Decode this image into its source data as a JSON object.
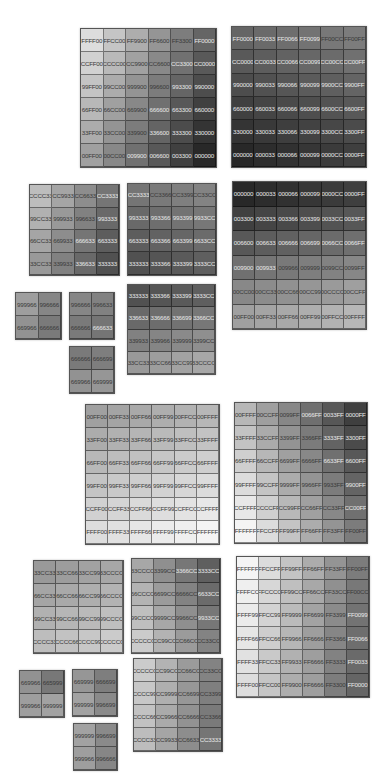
{
  "grids": [
    {
      "id": "g1",
      "x": 80,
      "y": 28,
      "w": 137,
      "h": 140,
      "cols": 6,
      "rows": [
        [
          "FFFF00",
          "FFCC00",
          "FF9900",
          "FF6600",
          "FF3300",
          "FF0000"
        ],
        [
          "CCFF00",
          "CCCC00",
          "CC9900",
          "CC6600",
          "CC3300",
          "CC0000"
        ],
        [
          "99FF00",
          "99CC00",
          "999900",
          "996600",
          "993300",
          "990000"
        ],
        [
          "66FF00",
          "66CC00",
          "669900",
          "666600",
          "663300",
          "660000"
        ],
        [
          "33FF00",
          "33CC00",
          "339900",
          "336600",
          "333300",
          "330000"
        ],
        [
          "00FF00",
          "00CC00",
          "009900",
          "006600",
          "003300",
          "000000"
        ]
      ]
    },
    {
      "id": "g2",
      "x": 231,
      "y": 26,
      "w": 136,
      "h": 142,
      "cols": 6,
      "rows": [
        [
          "FF0000",
          "FF0033",
          "FF0066",
          "FF0099",
          "FF00CC",
          "FF00FF"
        ],
        [
          "CC0000",
          "CC0033",
          "CC0066",
          "CC0099",
          "CC00CC",
          "CC00FF"
        ],
        [
          "990000",
          "990033",
          "990066",
          "990099",
          "9900CC",
          "9900FF"
        ],
        [
          "660000",
          "660033",
          "660066",
          "660099",
          "6600CC",
          "6600FF"
        ],
        [
          "330000",
          "330033",
          "330066",
          "330099",
          "3300CC",
          "3300FF"
        ],
        [
          "000000",
          "000033",
          "000066",
          "000099",
          "0000CC",
          "0000FF"
        ]
      ]
    },
    {
      "id": "g3",
      "x": 29,
      "y": 184,
      "w": 91,
      "h": 92,
      "cols": 4,
      "rows": [
        [
          "CCCC33",
          "CC9933",
          "CC6633",
          "CC3333"
        ],
        [
          "99CC33",
          "999933",
          "996633",
          "993333"
        ],
        [
          "66CC33",
          "669933",
          "666633",
          "663333"
        ],
        [
          "33CC33",
          "339933",
          "336633",
          "333333"
        ]
      ]
    },
    {
      "id": "g4",
      "x": 127,
      "y": 183,
      "w": 90,
      "h": 93,
      "cols": 4,
      "rows": [
        [
          "CC3333",
          "CC3366",
          "CC3399",
          "CC33CC"
        ],
        [
          "993333",
          "993366",
          "993399",
          "9933CC"
        ],
        [
          "663333",
          "663366",
          "663399",
          "6633CC"
        ],
        [
          "333333",
          "333366",
          "333399",
          "3333CC"
        ]
      ]
    },
    {
      "id": "g5",
      "x": 232,
      "y": 181,
      "w": 135,
      "h": 149,
      "cols": 6,
      "rows": [
        [
          "000000",
          "000033",
          "000066",
          "000099",
          "0000CC",
          "0000FF"
        ],
        [
          "003300",
          "003333",
          "003366",
          "003399",
          "0033CC",
          "0033FF"
        ],
        [
          "006600",
          "006633",
          "006666",
          "006699",
          "0066CC",
          "0066FF"
        ],
        [
          "009900",
          "009933",
          "009966",
          "009999",
          "0099CC",
          "0099FF"
        ],
        [
          "00CC00",
          "00CC33",
          "00CC66",
          "00CC99",
          "00CCCC",
          "00CCFF"
        ],
        [
          "00FF00",
          "00FF33",
          "00FF66",
          "00FF99",
          "00FFCC",
          "00FFFF"
        ]
      ]
    },
    {
      "id": "g6",
      "x": 15,
      "y": 292,
      "w": 47,
      "h": 48,
      "cols": 2,
      "rows": [
        [
          "999966",
          "996666"
        ],
        [
          "669966",
          "666666"
        ]
      ]
    },
    {
      "id": "g7",
      "x": 69,
      "y": 292,
      "w": 46,
      "h": 48,
      "cols": 2,
      "rows": [
        [
          "996666",
          "996633"
        ],
        [
          "666666",
          "666633"
        ]
      ]
    },
    {
      "id": "g8",
      "x": 127,
      "y": 284,
      "w": 89,
      "h": 91,
      "cols": 4,
      "rows": [
        [
          "333333",
          "333366",
          "333399",
          "3333CC"
        ],
        [
          "336633",
          "336666",
          "336699",
          "3366CC"
        ],
        [
          "339933",
          "339966",
          "339999",
          "3399CC"
        ],
        [
          "33CC33",
          "33CC66",
          "33CC99",
          "33CCCC"
        ]
      ]
    },
    {
      "id": "g9",
      "x": 69,
      "y": 346,
      "w": 46,
      "h": 48,
      "cols": 2,
      "rows": [
        [
          "666666",
          "666699"
        ],
        [
          "669966",
          "669999"
        ]
      ]
    },
    {
      "id": "g10",
      "x": 85,
      "y": 404,
      "w": 135,
      "h": 141,
      "cols": 6,
      "rows": [
        [
          "00FF00",
          "00FF33",
          "00FF66",
          "00FF99",
          "00FFCC",
          "00FFFF"
        ],
        [
          "33FF00",
          "33FF33",
          "33FF66",
          "33FF99",
          "33FFCC",
          "33FFFF"
        ],
        [
          "66FF00",
          "66FF33",
          "66FF66",
          "66FF99",
          "66FFCC",
          "66FFFF"
        ],
        [
          "99FF00",
          "99FF33",
          "99FF66",
          "99FF99",
          "99FFCC",
          "99FFFF"
        ],
        [
          "CCFF00",
          "CCFF33",
          "CCFF66",
          "CCFF99",
          "CCFFCC",
          "CCFFFF"
        ],
        [
          "FFFF00",
          "FFFF33",
          "FFFF66",
          "FFFF99",
          "FFFFCC",
          "FFFFFF"
        ]
      ]
    },
    {
      "id": "g11",
      "x": 234,
      "y": 402,
      "w": 134,
      "h": 142,
      "cols": 6,
      "rows": [
        [
          "00FFFF",
          "00CCFF",
          "0099FF",
          "0066FF",
          "0033FF",
          "0000FF"
        ],
        [
          "33FFFF",
          "33CCFF",
          "3399FF",
          "3366FF",
          "3333FF",
          "3300FF"
        ],
        [
          "66FFFF",
          "66CCFF",
          "6699FF",
          "6666FF",
          "6633FF",
          "6600FF"
        ],
        [
          "99FFFF",
          "99CCFF",
          "9999FF",
          "9966FF",
          "9933FF",
          "9900FF"
        ],
        [
          "CCFFFF",
          "CCCCFF",
          "CC99FF",
          "CC66FF",
          "CC33FF",
          "CC00FF"
        ],
        [
          "FFFFFF",
          "FFCCFF",
          "FF99FF",
          "FF66FF",
          "FF33FF",
          "FF00FF"
        ]
      ]
    },
    {
      "id": "g12",
      "x": 33,
      "y": 560,
      "w": 91,
      "h": 94,
      "cols": 4,
      "rows": [
        [
          "33CC33",
          "33CC66",
          "33CC99",
          "33CCCC"
        ],
        [
          "66CC33",
          "66CC66",
          "66CC99",
          "66CCCC"
        ],
        [
          "99CC33",
          "99CC66",
          "99CC99",
          "99CCCC"
        ],
        [
          "CCCC33",
          "CCCC66",
          "CCCC99",
          "CCCCCC"
        ]
      ]
    },
    {
      "id": "g13",
      "x": 131,
      "y": 558,
      "w": 90,
      "h": 96,
      "cols": 4,
      "rows": [
        [
          "33CCCC",
          "3399CC",
          "3366CC",
          "3333CC"
        ],
        [
          "66CCCC",
          "6699CC",
          "6666CC",
          "6633CC"
        ],
        [
          "99CCCC",
          "9999CC",
          "9966CC",
          "9933CC"
        ],
        [
          "CCCCCC",
          "CC99CC",
          "CC66CC",
          "CC33CC"
        ]
      ]
    },
    {
      "id": "g14",
      "x": 236,
      "y": 556,
      "w": 134,
      "h": 142,
      "cols": 6,
      "rows": [
        [
          "FFFFFF",
          "FFCCFF",
          "FF99FF",
          "FF66FF",
          "FF33FF",
          "FF00FF"
        ],
        [
          "FFFFCC",
          "FFCCCC",
          "FF99CC",
          "FF66CC",
          "FF33CC",
          "FF00CC"
        ],
        [
          "FFFF99",
          "FFCC99",
          "FF9999",
          "FF6699",
          "FF3399",
          "FF0099"
        ],
        [
          "FFFF66",
          "FFCC66",
          "FF9966",
          "FF6666",
          "FF3366",
          "FF0066"
        ],
        [
          "FFFF33",
          "FFCC33",
          "FF9933",
          "FF6666",
          "FF3333",
          "FF0033"
        ],
        [
          "FFFF00",
          "FFCC00",
          "FF9900",
          "FF6666",
          "FF3300",
          "FF0000"
        ]
      ]
    },
    {
      "id": "g15",
      "x": 19,
      "y": 670,
      "w": 46,
      "h": 48,
      "cols": 2,
      "rows": [
        [
          "669966",
          "665999"
        ],
        [
          "999966",
          "999999"
        ]
      ]
    },
    {
      "id": "g16",
      "x": 72,
      "y": 669,
      "w": 46,
      "h": 48,
      "cols": 2,
      "rows": [
        [
          "669999",
          "666699"
        ],
        [
          "999999",
          "996699"
        ]
      ]
    },
    {
      "id": "g17",
      "x": 73,
      "y": 723,
      "w": 45,
      "h": 48,
      "cols": 2,
      "rows": [
        [
          "999999",
          "996699"
        ],
        [
          "999966",
          "996666"
        ]
      ]
    },
    {
      "id": "g18",
      "x": 133,
      "y": 658,
      "w": 90,
      "h": 94,
      "cols": 4,
      "rows": [
        [
          "CCCCCC",
          "CC99CC",
          "CC66CC",
          "CC33CC"
        ],
        [
          "CCCC99",
          "CC9999",
          "CC6699",
          "CC3399"
        ],
        [
          "CCCC66",
          "CC9966",
          "CC6666",
          "CC3366"
        ],
        [
          "CCCC33",
          "CC9933",
          "CC6633",
          "CC3333"
        ]
      ]
    }
  ]
}
